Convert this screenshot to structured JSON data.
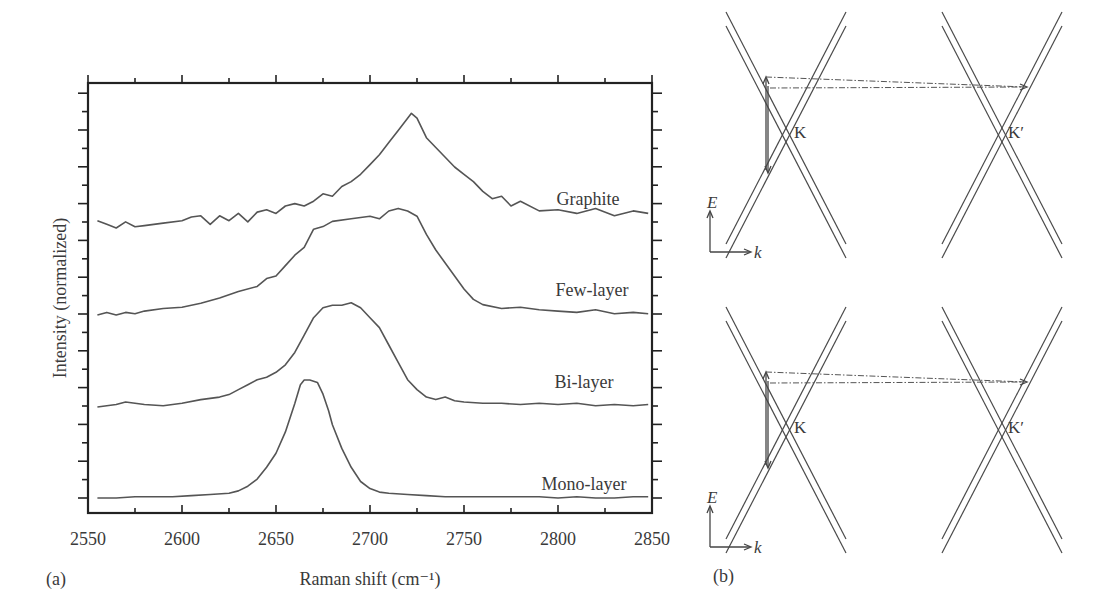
{
  "figure": {
    "panel_a_label": "(a)",
    "panel_b_label": "(b)"
  },
  "chart_data": [
    {
      "type": "line",
      "title": "",
      "xlabel": "Raman shift (cm⁻¹)",
      "ylabel": "Intensity (normalized)",
      "xlim": [
        2550,
        2850
      ],
      "x_ticks": [
        2550,
        2600,
        2650,
        2700,
        2750,
        2800,
        2850
      ],
      "x_tick_labels": [
        "2550",
        "2600",
        "2650",
        "2700",
        "2750",
        "2800",
        "2850"
      ],
      "y_ticks_labeled": false,
      "grid": false,
      "legend": "inline labels at right of each curve",
      "series": [
        {
          "name": "Graphite",
          "label_x": 2790,
          "offset": 3.0,
          "x": [
            2555,
            2560,
            2565,
            2570,
            2575,
            2580,
            2590,
            2600,
            2605,
            2610,
            2615,
            2620,
            2625,
            2630,
            2635,
            2640,
            2645,
            2650,
            2655,
            2660,
            2665,
            2670,
            2675,
            2680,
            2685,
            2690,
            2695,
            2700,
            2705,
            2710,
            2715,
            2720,
            2722,
            2725,
            2730,
            2735,
            2740,
            2745,
            2750,
            2755,
            2760,
            2765,
            2770,
            2775,
            2780,
            2790,
            2800,
            2810,
            2820,
            2830,
            2840,
            2848
          ],
          "y": [
            0.06,
            0.03,
            0.0,
            0.05,
            0.01,
            0.02,
            0.04,
            0.06,
            0.09,
            0.1,
            0.03,
            0.1,
            0.06,
            0.12,
            0.05,
            0.13,
            0.15,
            0.12,
            0.18,
            0.2,
            0.18,
            0.22,
            0.28,
            0.26,
            0.34,
            0.38,
            0.44,
            0.52,
            0.6,
            0.7,
            0.8,
            0.9,
            0.94,
            0.9,
            0.74,
            0.66,
            0.58,
            0.5,
            0.44,
            0.38,
            0.3,
            0.24,
            0.26,
            0.18,
            0.22,
            0.14,
            0.15,
            0.12,
            0.16,
            0.1,
            0.14,
            0.12
          ]
        },
        {
          "name": "Few-layer",
          "label_x": 2790,
          "offset": 2.0,
          "x": [
            2555,
            2560,
            2565,
            2570,
            2575,
            2580,
            2590,
            2600,
            2610,
            2620,
            2630,
            2640,
            2645,
            2650,
            2655,
            2660,
            2665,
            2670,
            2675,
            2680,
            2690,
            2695,
            2700,
            2705,
            2710,
            2715,
            2720,
            2725,
            2730,
            2735,
            2740,
            2745,
            2750,
            2755,
            2760,
            2770,
            2780,
            2790,
            2800,
            2810,
            2820,
            2830,
            2840,
            2848
          ],
          "y": [
            0.0,
            0.02,
            0.0,
            0.02,
            0.01,
            0.03,
            0.05,
            0.06,
            0.09,
            0.13,
            0.18,
            0.22,
            0.28,
            0.3,
            0.38,
            0.46,
            0.52,
            0.66,
            0.68,
            0.72,
            0.74,
            0.75,
            0.76,
            0.74,
            0.8,
            0.82,
            0.8,
            0.76,
            0.62,
            0.5,
            0.4,
            0.3,
            0.2,
            0.12,
            0.08,
            0.05,
            0.06,
            0.04,
            0.03,
            0.02,
            0.04,
            0.01,
            0.02,
            0.01
          ]
        },
        {
          "name": "Bi-layer",
          "label_x": 2790,
          "offset": 1.0,
          "x": [
            2555,
            2560,
            2565,
            2570,
            2575,
            2580,
            2590,
            2595,
            2600,
            2610,
            2620,
            2625,
            2630,
            2635,
            2640,
            2645,
            2650,
            2655,
            2660,
            2665,
            2670,
            2675,
            2680,
            2685,
            2690,
            2695,
            2700,
            2705,
            2710,
            2715,
            2720,
            2725,
            2730,
            2735,
            2740,
            2745,
            2750,
            2760,
            2770,
            2780,
            2790,
            2800,
            2810,
            2820,
            2830,
            2840,
            2848
          ],
          "y": [
            0.0,
            0.01,
            0.02,
            0.04,
            0.03,
            0.02,
            0.01,
            0.02,
            0.03,
            0.06,
            0.08,
            0.1,
            0.14,
            0.18,
            0.22,
            0.24,
            0.28,
            0.34,
            0.44,
            0.58,
            0.72,
            0.8,
            0.82,
            0.82,
            0.84,
            0.8,
            0.72,
            0.64,
            0.5,
            0.36,
            0.22,
            0.14,
            0.08,
            0.06,
            0.08,
            0.05,
            0.04,
            0.03,
            0.03,
            0.02,
            0.03,
            0.02,
            0.03,
            0.01,
            0.02,
            0.01,
            0.02
          ]
        },
        {
          "name": "Mono-layer",
          "label_x": 2790,
          "offset": 0.0,
          "x": [
            2555,
            2565,
            2575,
            2585,
            2595,
            2605,
            2615,
            2625,
            2630,
            2635,
            2640,
            2645,
            2650,
            2655,
            2660,
            2663,
            2665,
            2668,
            2672,
            2675,
            2678,
            2680,
            2685,
            2690,
            2695,
            2700,
            2705,
            2710,
            2720,
            2730,
            2740,
            2750,
            2760,
            2770,
            2780,
            2790,
            2800,
            2810,
            2820,
            2830,
            2840,
            2848
          ],
          "y": [
            0.0,
            0.0,
            0.01,
            0.01,
            0.01,
            0.02,
            0.03,
            0.04,
            0.06,
            0.1,
            0.16,
            0.26,
            0.38,
            0.56,
            0.8,
            0.96,
            1.0,
            1.0,
            0.98,
            0.88,
            0.74,
            0.62,
            0.42,
            0.26,
            0.14,
            0.08,
            0.05,
            0.04,
            0.03,
            0.02,
            0.01,
            0.01,
            0.01,
            0.01,
            0.01,
            0.01,
            0.0,
            0.01,
            0.0,
            0.0,
            0.01,
            0.01
          ]
        }
      ]
    },
    {
      "type": "diagram",
      "title": "Double-resonance band diagrams",
      "panels": [
        {
          "valleys": [
            "K",
            "K′"
          ],
          "axis_labels": {
            "y": "E",
            "x": "k"
          },
          "transitions": "vertical excitation at K, dash-dot phonon scattering K → K′ and back"
        },
        {
          "valleys": [
            "K",
            "K′"
          ],
          "axis_labels": {
            "y": "E",
            "x": "k"
          },
          "transitions": "vertical excitation at K, dash-dot phonon scattering K → K′ and back"
        }
      ]
    }
  ],
  "labels": {
    "valley_k": "K",
    "valley_kp": "K′",
    "axis_e": "E",
    "axis_k": "k"
  }
}
